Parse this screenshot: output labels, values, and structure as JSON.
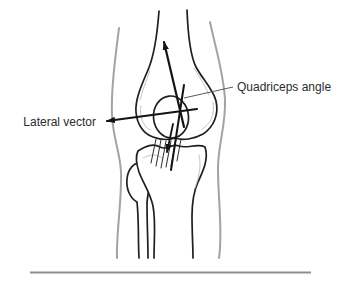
{
  "figure": {
    "labels": {
      "quadriceps_angle": "Quadriceps angle",
      "lateral_vector": "Lateral vector"
    },
    "colors": {
      "background": "#ffffff",
      "skin_outline": "#a3a3a3",
      "bone_outline": "#1f1f1f",
      "sketch_accent": "#c4c4c4",
      "arrow": "#141414",
      "tendon_hatch": "#2a2a2a",
      "leader_line": "#5a5a5a",
      "label_text": "#2b2b2b",
      "divider": "#8f8f8f"
    }
  }
}
